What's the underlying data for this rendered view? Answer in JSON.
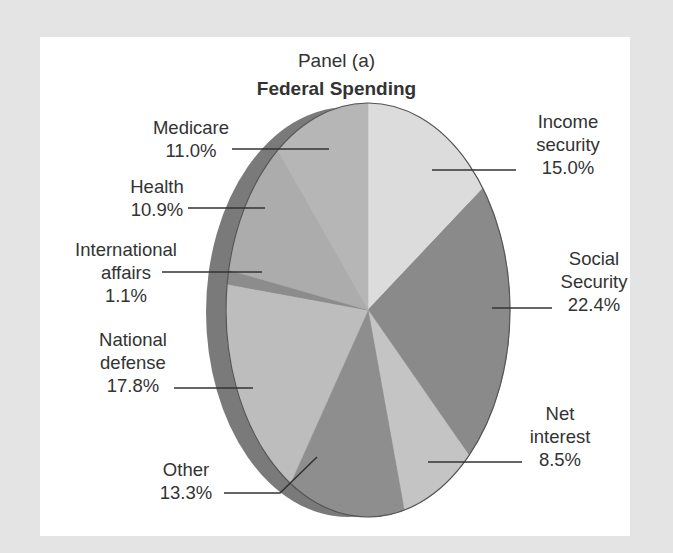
{
  "chart_data": {
    "type": "pie",
    "title": "Federal Spending",
    "subtitle": "Panel (a)",
    "unit": "%",
    "start_angle": "12 o'clock",
    "direction": "clockwise",
    "three_d": true,
    "slices": [
      {
        "name": "Income security",
        "value": 15.0,
        "label": "15.0%",
        "color": "#dcdcdc"
      },
      {
        "name": "Social Security",
        "value": 22.4,
        "label": "22.4%",
        "color": "#8a8a8a"
      },
      {
        "name": "Net interest",
        "value": 8.5,
        "label": "8.5%",
        "color": "#c4c4c4"
      },
      {
        "name": "Other",
        "value": 13.3,
        "label": "13.3%",
        "color": "#8e8e8e"
      },
      {
        "name": "National defense",
        "value": 17.8,
        "label": "17.8%",
        "color": "#bdbdbd"
      },
      {
        "name": "International affairs",
        "value": 1.1,
        "label": "1.1%",
        "color": "#8c8c8c"
      },
      {
        "name": "Health",
        "value": 10.9,
        "label": "10.9%",
        "color": "#acacac"
      },
      {
        "name": "Medicare",
        "value": 11.0,
        "label": "11.0%",
        "color": "#b6b6b6"
      }
    ]
  },
  "labels": {
    "panel": "Panel (a)",
    "title": "Federal Spending",
    "income_security": "Income\nsecurity\n15.0%",
    "social_security": "Social\nSecurity\n22.4%",
    "net_interest": "Net\ninterest\n8.5%",
    "other": "Other\n13.3%",
    "national_defense": "National\ndefense\n17.8%",
    "international_affairs": "International\naffairs\n1.1%",
    "health": "Health\n10.9%",
    "medicare": "Medicare\n11.0%"
  },
  "colors": {
    "background": "#e4e4e4",
    "panel": "#ffffff",
    "edge": "#7a7a7a",
    "outline": "#555555",
    "leader": "#333333",
    "text": "#333333"
  }
}
